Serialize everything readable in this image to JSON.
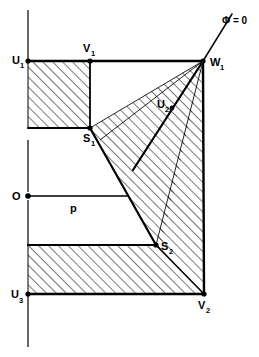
{
  "figure": {
    "background_color": "#ffffff",
    "stroke_color": "#000000",
    "hatch_color": "#000000",
    "width": 259,
    "height": 357
  },
  "labels": {
    "u1": {
      "base": "U",
      "sub": "1"
    },
    "v1": {
      "base": "V",
      "sub": "1"
    },
    "w1": {
      "base": "W",
      "sub": "1"
    },
    "u2": {
      "base": "U",
      "sub": "2"
    },
    "s1": {
      "base": "S",
      "sub": "1"
    },
    "s2": {
      "base": "S",
      "sub": "2"
    },
    "u3": {
      "base": "U",
      "sub": "3"
    },
    "v2": {
      "base": "V",
      "sub": "2"
    },
    "origin": {
      "base": "O",
      "sub": ""
    },
    "p": {
      "base": "p",
      "sub": ""
    },
    "phi": {
      "base": "Φ = 0",
      "sub": ""
    }
  },
  "points": {
    "U1": {
      "x": 28,
      "y": 61
    },
    "V1": {
      "x": 90,
      "y": 61
    },
    "W1": {
      "x": 203,
      "y": 61
    },
    "U2": {
      "x": 172,
      "y": 108
    },
    "S1": {
      "x": 90,
      "y": 128
    },
    "O": {
      "x": 28,
      "y": 196
    },
    "Pend": {
      "x": 127,
      "y": 196
    },
    "S2": {
      "x": 156,
      "y": 245
    },
    "U3": {
      "x": 28,
      "y": 294
    },
    "V2": {
      "x": 204,
      "y": 294
    },
    "PhiTip": {
      "x": 232,
      "y": 14
    }
  },
  "axis": {
    "x": 28,
    "segments": [
      {
        "y1": 10,
        "y2": 61
      },
      {
        "y1": 140,
        "y2": 196
      },
      {
        "y1": 200,
        "y2": 245
      },
      {
        "y1": 294,
        "y2": 347
      }
    ]
  }
}
